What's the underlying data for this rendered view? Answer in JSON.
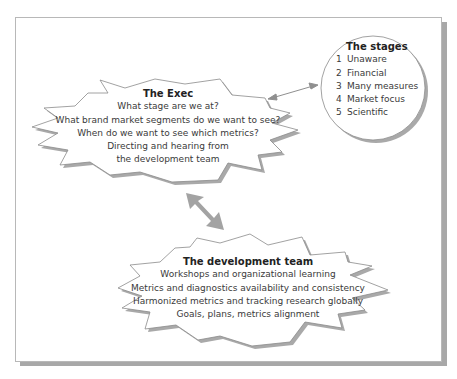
{
  "exec": {
    "title": "The Exec",
    "lines": [
      "What stage are we at?",
      "What brand market segments do we want to see?",
      "When do we want to see which metrics?",
      "Directing and hearing from",
      "the development team"
    ]
  },
  "stages": {
    "title": "The stages",
    "items": [
      {
        "num": "1",
        "label": "Unaware"
      },
      {
        "num": "2",
        "label": "Financial"
      },
      {
        "num": "3",
        "label": "Many measures"
      },
      {
        "num": "4",
        "label": "Market focus"
      },
      {
        "num": "5",
        "label": "Scientific"
      }
    ]
  },
  "dev_team": {
    "title": "The development team",
    "lines": [
      "Workshops and organizational learning",
      "Metrics and diagnostics availability and consistency",
      "Harmonized metrics and tracking research globally",
      "Goals, plans, metrics alignment"
    ]
  },
  "colors": {
    "shape_fill": "#ffffff",
    "outline": "#8a8a8a",
    "shadow": "#a9a9a9",
    "arrow": "#a0a0a0"
  }
}
